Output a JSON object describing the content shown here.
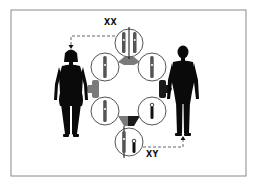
{
  "diagram": {
    "type": "sex-chromosome inheritance cycle",
    "labels": {
      "female_genotype": "XX",
      "male_genotype": "XY"
    },
    "nodes": [
      {
        "id": "zygote-xx",
        "label": "XX",
        "position": "top",
        "contents": "two X chromosomes"
      },
      {
        "id": "egg-1",
        "position": "upper-left",
        "contents": "one X chromosome"
      },
      {
        "id": "egg-2",
        "position": "lower-left",
        "contents": "one X chromosome"
      },
      {
        "id": "sperm-x",
        "position": "upper-right",
        "contents": "one X chromosome"
      },
      {
        "id": "sperm-y",
        "position": "lower-right",
        "contents": "one Y chromosome"
      },
      {
        "id": "zygote-xy",
        "label": "XY",
        "position": "bottom",
        "contents": "X and Y chromosomes"
      }
    ],
    "figures": [
      {
        "id": "female",
        "position": "left",
        "linked_to": "zygote-xx"
      },
      {
        "id": "male",
        "position": "right",
        "linked_to": "zygote-xy"
      }
    ],
    "colors": {
      "figure": "#0a0a0a",
      "circle_stroke": "#555555",
      "connector_female": "#7a7a7a",
      "connector_male": "#1a1a1a",
      "border": "#8a8a8a",
      "dashed_line": "#555555"
    }
  }
}
